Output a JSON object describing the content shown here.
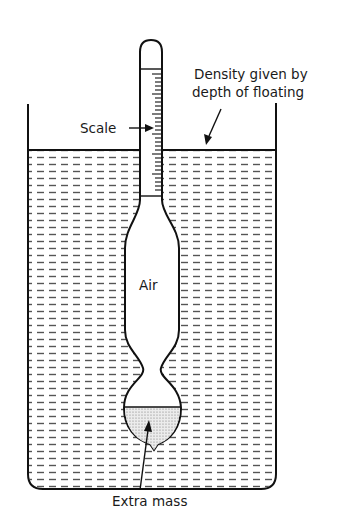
{
  "diagram": {
    "labels": {
      "scale": "Scale",
      "air": "Air",
      "extra_mass": "Extra mass",
      "density_line1": "Density given by",
      "density_line2": "depth of floating"
    },
    "colors": {
      "ink": "#111111",
      "liquid_dash": "#555555",
      "mass_fill": "#d9d9d9",
      "background": "#ffffff"
    }
  }
}
